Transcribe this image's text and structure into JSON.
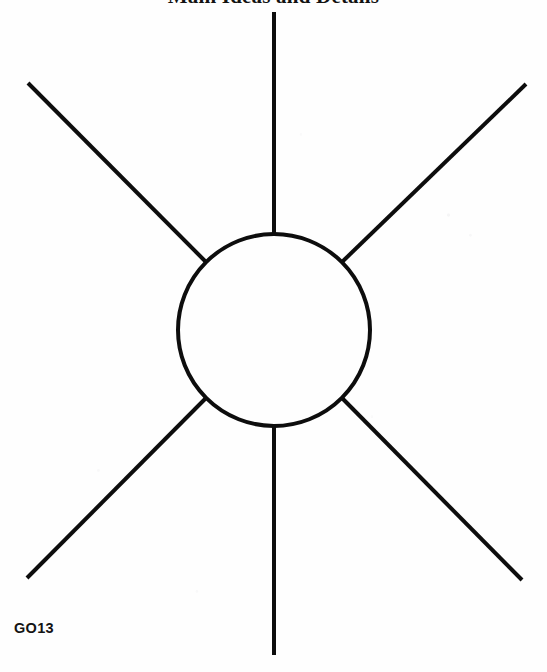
{
  "page": {
    "width": 547,
    "height": 672,
    "background_color": "#fefefe"
  },
  "title": {
    "text": "Main Ideas and Details",
    "color": "#121212",
    "clipped_at_top": true
  },
  "code_label": {
    "text": "GO13",
    "color": "#141414"
  },
  "diagram": {
    "type": "web-cluster-organizer",
    "stroke_color": "#0d0d0d",
    "stroke_width": 4,
    "fill_color": "none",
    "center_circle": {
      "label": "center-circle",
      "cx": 274,
      "cy": 330,
      "r": 96
    },
    "ray_count": 6,
    "rays": [
      {
        "label": "ray-top",
        "x1": 274,
        "y1": 234,
        "x2": 274,
        "y2": 12
      },
      {
        "label": "ray-upper-right",
        "x1": 342,
        "y1": 262,
        "x2": 526,
        "y2": 84
      },
      {
        "label": "ray-lower-right",
        "x1": 342,
        "y1": 398,
        "x2": 522,
        "y2": 580
      },
      {
        "label": "ray-bottom",
        "x1": 274,
        "y1": 426,
        "x2": 274,
        "y2": 655
      },
      {
        "label": "ray-lower-left",
        "x1": 206,
        "y1": 398,
        "x2": 27,
        "y2": 578
      },
      {
        "label": "ray-upper-left",
        "x1": 206,
        "y1": 262,
        "x2": 28,
        "y2": 83
      }
    ]
  }
}
